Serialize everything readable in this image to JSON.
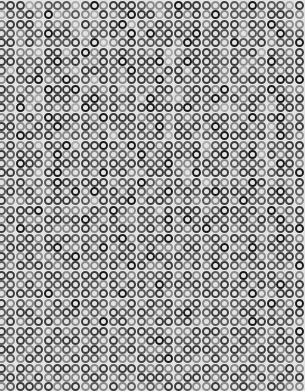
{
  "pattern": {
    "type": "ring-grid",
    "background": "#e4e4e4",
    "cols": 33,
    "rows": 42,
    "spacing_x": 9.3,
    "spacing_y": 9.3,
    "offset_x": -3,
    "offset_y": 1,
    "palette": [
      "#1a1a1a",
      "#3c3c3c",
      "#5a5a5a",
      "#8a8a8a",
      "#ababab"
    ],
    "shades": [
      "2114322242031112332011231230222410",
      "4221304323413201142131303222311230",
      "3111423241321042312221311131202330",
      "2232201134221303021120212242230221",
      "1131322213043212221301213022132201",
      "2233411420312122314321123221412311",
      "1122210213312021104201122133202213",
      "2413122341122302231141223142323221",
      "3121032022412311203122113221120102",
      "1232301103231422311321130323202330",
      "2213411131022214023421202131130212",
      "1304223240121321011102234321341123",
      "3221301112301113213232121230210321",
      "1133120231232221303121302313241210",
      "2201213322314122214113220112130231",
      "3132412041101302131221421131322113",
      "1212130312323230321120310310413221",
      "2301231121221211220332123222240130",
      "1122410332302133111240211311321202",
      "3213220121113220232131423230132311",
      "2121331303021312320212101121310223",
      "1332211122412103112323231302221130",
      "2211032333120231241111320121303213",
      "3123311210231332220302112213120321",
      "1302123321312122131231031322231102",
      "2221312122221031210222213121320231",
      "3112210331303213133311320330212213",
      "1231332102122122012122213111331120",
      "2312123213321301331231301232122302",
      "1123211321102232221313122302213231",
      "2231322112231311302121231213120213",
      "3112103221312022213232112130331122",
      "1323231302123313121321323222102301",
      "2211322113231221232102211311323113",
      "3132113231302132311213322230112231",
      "1221231322113211223331113121231302",
      "2312312113231323101222231312321121",
      "1123123231122212332311122123113213",
      "3231212312231331210123313232212322",
      "1312321121312112323232121311323131",
      "2123132332123231112311232123131213",
      "3211213213231323231123313212312332"
    ]
  }
}
